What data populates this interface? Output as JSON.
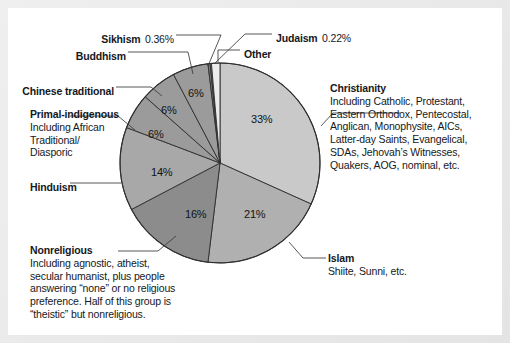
{
  "chart_data": {
    "type": "pie",
    "title": "",
    "categories": [
      "Christianity",
      "Islam",
      "Nonreligious",
      "Hinduism",
      "Primal-indigenous",
      "Chinese traditional",
      "Buddhism",
      "Sikhism",
      "Judaism",
      "Other"
    ],
    "values": [
      33,
      21,
      16,
      14,
      6,
      6,
      6,
      0.36,
      0.22,
      1.42
    ],
    "value_labels": [
      "33%",
      "21%",
      "16%",
      "14%",
      "6%",
      "6%",
      "6%",
      "0.36%",
      "0.22%",
      ""
    ],
    "legend": "callout-labels",
    "start_angle_deg": 0,
    "direction": "clockwise",
    "colors": [
      "#c9c9c9",
      "#b0b0b0",
      "#8c8c8c",
      "#a8a8a8",
      "#9b9b9b",
      "#9b9b9b",
      "#9b9b9b",
      "#7e7e7e",
      "#7e7e7e",
      "#ececec"
    ]
  },
  "slice_labels": [
    {
      "pct": "33%"
    },
    {
      "pct": "21%"
    },
    {
      "pct": "16%"
    },
    {
      "pct": "14%"
    },
    {
      "pct": "6%"
    },
    {
      "pct": "6%"
    },
    {
      "pct": "6%"
    }
  ],
  "callouts": {
    "sikhism": {
      "name": "Sikhism",
      "pct": "0.36%"
    },
    "judaism": {
      "name": "Judaism",
      "pct": "0.22%"
    },
    "buddhism": {
      "name": "Buddhism"
    },
    "other": {
      "name": "Other"
    },
    "chinese_traditional": {
      "name": "Chinese traditional"
    },
    "primal_indigenous": {
      "name": "Primal-indigenous",
      "line1": "Including African",
      "line2": "Traditional/",
      "line3": "Diasporic"
    },
    "hinduism": {
      "name": "Hinduism"
    },
    "nonreligious": {
      "name": "Nonreligious",
      "line1": "Including agnostic, atheist,",
      "line2": "secular humanist, plus people",
      "line3": "answering “none” or no religious",
      "line4": "preference. Half of this group is",
      "line5": "“theistic” but nonreligious."
    },
    "christianity": {
      "name": "Christianity",
      "line1": "Including Catholic, Protestant,",
      "line2": "Eastern Orthodox, Pentecostal,",
      "line3": "Anglican, Monophysite, AICs,",
      "line4": "Latter-day Saints, Evangelical,",
      "line5": "SDAs, Jehovah’s Witnesses,",
      "line6": "Quakers, AOG, nominal, etc."
    },
    "islam": {
      "name": "Islam",
      "line1": "Shiite, Sunni, etc."
    }
  }
}
